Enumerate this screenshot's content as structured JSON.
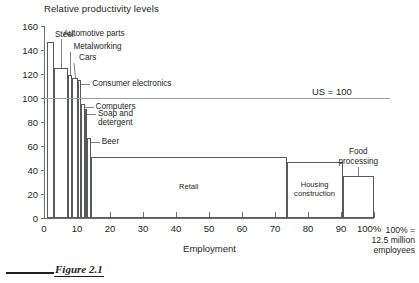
{
  "figure": {
    "caption": "Figure 2.1"
  },
  "chart_data": {
    "type": "bar",
    "title": "Relative productivity levels",
    "xlabel": "Employment",
    "ylabel": "",
    "xlim": [
      0,
      100
    ],
    "ylim": [
      0,
      160
    ],
    "ytick_labels": [
      "0",
      "20",
      "40",
      "60",
      "80",
      "100",
      "120",
      "140",
      "160"
    ],
    "ytick_values": [
      0,
      20,
      40,
      60,
      80,
      100,
      120,
      140,
      160
    ],
    "xtick_labels": [
      "0",
      "10",
      "20",
      "30",
      "40",
      "50",
      "60",
      "70",
      "80",
      "90",
      "100%"
    ],
    "xtick_values": [
      0,
      10,
      20,
      30,
      40,
      50,
      60,
      70,
      80,
      90,
      100
    ],
    "grid": false,
    "legend": "none",
    "note": "100% =\n12.5 million\nemployees",
    "reference_line": {
      "label": "US = 100",
      "value": 100
    },
    "variable_width_bars": true,
    "x_is_cumulative_employment_share": true,
    "bars": [
      {
        "name": "Steel",
        "x_start": 1.0,
        "x_end": 3.0,
        "value": 147,
        "label_mode": "callout"
      },
      {
        "name": "Automotive parts",
        "x_start": 3.0,
        "x_end": 7.4,
        "value": 125,
        "label_mode": "callout"
      },
      {
        "name": "Metalworking",
        "x_start": 7.4,
        "x_end": 8.6,
        "value": 119,
        "label_mode": "callout"
      },
      {
        "name": "Cars",
        "x_start": 8.6,
        "x_end": 10.2,
        "value": 117,
        "label_mode": "callout"
      },
      {
        "name": "Consumer electronics",
        "x_start": 10.2,
        "x_end": 11.3,
        "value": 115,
        "label_mode": "callout"
      },
      {
        "name": "Computers",
        "x_start": 11.3,
        "x_end": 12.3,
        "value": 95,
        "label_mode": "callout"
      },
      {
        "name": "Soap and detergent",
        "x_start": 12.3,
        "x_end": 13.0,
        "value": 91,
        "label_mode": "callout"
      },
      {
        "name": "Beer",
        "x_start": 13.0,
        "x_end": 14.2,
        "value": 67,
        "label_mode": "callout"
      },
      {
        "name": "Retail",
        "x_start": 14.2,
        "x_end": 73.5,
        "value": 51,
        "label_mode": "inside"
      },
      {
        "name": "Housing construction",
        "x_start": 73.5,
        "x_end": 90.5,
        "value": 47,
        "label_mode": "inside"
      },
      {
        "name": "Food processing",
        "x_start": 90.5,
        "x_end": 100.0,
        "value": 35,
        "label_mode": "callout"
      }
    ]
  },
  "callouts": {
    "steel": "Steel",
    "automotive_parts": "Automotive parts",
    "metalworking": "Metalworking",
    "cars": "Cars",
    "consumer_electronics": "Consumer electronics",
    "computers": "Computers",
    "soap_and_detergent": "Soap and\ndetergent",
    "beer": "Beer",
    "food_processing": "Food\nprocessing"
  },
  "inside_labels": {
    "retail": "Retail",
    "housing_construction": "Housing\nconstruction"
  },
  "colors": {
    "bar_stroke": "#58595b",
    "axis": "#6d6e70",
    "reference_line": "#9b9ea1",
    "text": "#231f20",
    "background": "#ffffff"
  }
}
